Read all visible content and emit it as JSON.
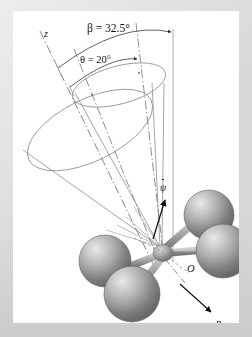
{
  "figure": {
    "kind": "mechanics-diagram",
    "background_color": "#d8d8d8",
    "canvas_color": "#ffffff",
    "line_color": "#8a8a8a",
    "ink_color": "#141414",
    "sphere_color": "#9a9a9a"
  },
  "labels": {
    "beta": "β = 32.5°",
    "theta": "θ = 20°",
    "z_axis": "z",
    "precession_rate": "ψ",
    "origin": "O",
    "spin_axis": "p"
  },
  "annotations": {
    "beta_value": "32.5",
    "beta_symbol": "β",
    "theta_value": "20",
    "theta_symbol": "θ",
    "degree_sign": "°",
    "psi_symbol": "ψ",
    "psi_has_overdot": "true"
  },
  "geometry": {
    "apex": "160,247",
    "vertical_reference_line_x": "173",
    "z_axis_line": "from 38,27 to 150,262",
    "outer_cone_half_angle_label": "beta",
    "inner_cone_half_angle_label": "theta",
    "sphere_count": "4"
  }
}
